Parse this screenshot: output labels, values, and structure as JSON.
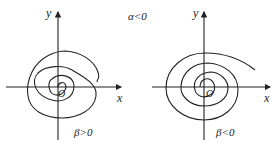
{
  "top_condition": "α<0",
  "left": {
    "y_label": "y",
    "x_label": "x",
    "origin_label": "O",
    "condition": "β>0",
    "direction": "counterclockwise spiral"
  },
  "right": {
    "y_label": "y",
    "x_label": "x",
    "origin_label": "O",
    "condition": "β<0",
    "direction": "clockwise spiral"
  },
  "colors": {
    "stroke": "#222222",
    "background": "#ffffff"
  }
}
